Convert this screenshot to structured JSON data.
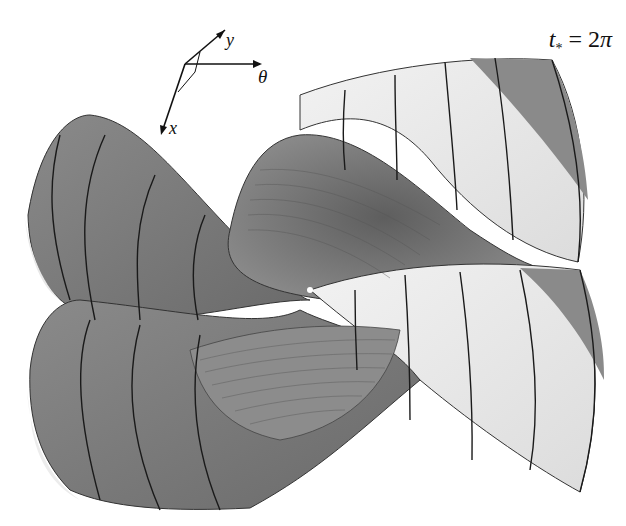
{
  "figure": {
    "type": "3D surface rendering",
    "time_label": {
      "var": "t",
      "sub": "*",
      "eq": " = 2",
      "pi": "π"
    },
    "axes": {
      "x": "x",
      "y": "y",
      "theta": "θ"
    },
    "colors": {
      "dark_surface": "#7a7a7a",
      "mid_surface": "#9a9a9a",
      "light_surface": "#eeeeee",
      "grid_lines": "#222222",
      "background": "#ffffff"
    }
  }
}
